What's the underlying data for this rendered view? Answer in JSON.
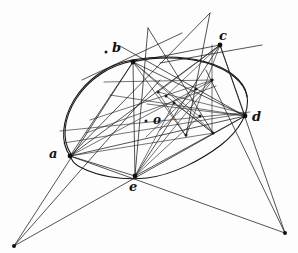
{
  "figure": {
    "background_color": "#fdfdfd",
    "ink_color": "#1a1a1a",
    "canvas": {
      "width": 298,
      "height": 253
    }
  },
  "labels": [
    {
      "id": "b",
      "text": "b",
      "x": 112,
      "y": 41,
      "size": "normal"
    },
    {
      "id": "c",
      "text": "c",
      "x": 219,
      "y": 29,
      "size": "normal"
    },
    {
      "id": "d",
      "text": "d",
      "x": 252,
      "y": 110,
      "size": "normal"
    },
    {
      "id": "o",
      "text": "o",
      "x": 153,
      "y": 114,
      "size": "small"
    },
    {
      "id": "a",
      "text": "a",
      "x": 49,
      "y": 147,
      "size": "normal"
    },
    {
      "id": "e",
      "text": "e",
      "x": 129,
      "y": 180,
      "size": "normal"
    }
  ],
  "vertices": [
    {
      "id": "a",
      "x": 70,
      "y": 156
    },
    {
      "id": "b",
      "x": 133,
      "y": 62
    },
    {
      "id": "c",
      "x": 220,
      "y": 45
    },
    {
      "id": "d",
      "x": 245,
      "y": 116
    },
    {
      "id": "e",
      "x": 135,
      "y": 176
    },
    {
      "id": "o",
      "x": 165,
      "y": 121
    },
    {
      "id": "p-left",
      "x": 14,
      "y": 246
    },
    {
      "id": "p-right",
      "x": 285,
      "y": 233
    },
    {
      "id": "x-top-left",
      "x": 148,
      "y": 28
    },
    {
      "id": "x-top-right",
      "x": 210,
      "y": 13
    }
  ],
  "conic": {
    "type": "ellipse",
    "center_x": 156,
    "center_y": 116,
    "radius_x": 95,
    "radius_y": 62,
    "rotation_deg": -22
  },
  "chords": [
    {
      "from": "a",
      "to": "b"
    },
    {
      "from": "a",
      "to": "c"
    },
    {
      "from": "a",
      "to": "d"
    },
    {
      "from": "a",
      "to": "e"
    },
    {
      "from": "b",
      "to": "c"
    },
    {
      "from": "b",
      "to": "d"
    },
    {
      "from": "b",
      "to": "e"
    },
    {
      "from": "c",
      "to": "d"
    },
    {
      "from": "c",
      "to": "e"
    },
    {
      "from": "d",
      "to": "e"
    }
  ],
  "node_dots": [
    {
      "x": 158,
      "y": 92
    },
    {
      "x": 174,
      "y": 103
    },
    {
      "x": 196,
      "y": 89
    },
    {
      "x": 212,
      "y": 80
    },
    {
      "x": 200,
      "y": 116
    },
    {
      "x": 213,
      "y": 133
    },
    {
      "x": 186,
      "y": 135
    },
    {
      "x": 166,
      "y": 96
    },
    {
      "x": 106,
      "y": 52
    },
    {
      "x": 146,
      "y": 121
    }
  ],
  "perspective_rays": [
    {
      "from": "p-left",
      "to": "b"
    },
    {
      "from": "p-left",
      "to": "c"
    },
    {
      "from": "p-left",
      "to": "d"
    },
    {
      "from": "p-right",
      "to": "a"
    },
    {
      "from": "p-right",
      "to": "b"
    },
    {
      "from": "p-right",
      "to": "c"
    }
  ],
  "tangents": [
    {
      "id": "tangent-at-b",
      "x1": 82,
      "y1": 80,
      "x2": 182,
      "y2": 33
    },
    {
      "id": "tangent-at-c",
      "x1": 160,
      "y1": 63,
      "x2": 262,
      "y2": 45
    }
  ]
}
